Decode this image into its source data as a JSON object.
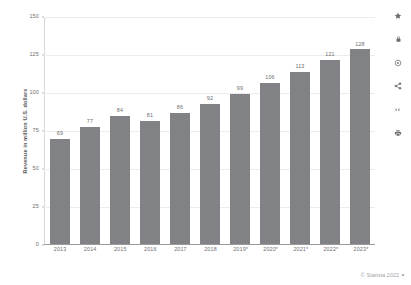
{
  "chart_data": {
    "type": "bar",
    "title": "",
    "xlabel": "",
    "ylabel": "Revenue in million U.S. dollars",
    "categories": [
      "2013",
      "2014",
      "2015",
      "2016",
      "2017",
      "2018",
      "2019*",
      "2020*",
      "2021*",
      "2022*",
      "2023*"
    ],
    "values": [
      69,
      77,
      84,
      81,
      86,
      92,
      99,
      106,
      113,
      121,
      128
    ],
    "ylim": [
      0,
      150
    ],
    "yticks": [
      "0",
      "25",
      "50",
      "75",
      "100",
      "125",
      "150"
    ],
    "ytick_values": [
      0,
      25,
      50,
      75,
      100,
      125,
      150
    ],
    "grid": true,
    "legend": "none",
    "bar_color": "#808285",
    "label_color": "#6d6e71"
  },
  "toolbar": {
    "icons": [
      {
        "name": "star-icon",
        "label": "Favorite"
      },
      {
        "name": "lock-icon",
        "label": "Locked"
      },
      {
        "name": "gear-icon",
        "label": "Settings"
      },
      {
        "name": "share-icon",
        "label": "Share"
      },
      {
        "name": "quote-icon",
        "label": "Cite"
      },
      {
        "name": "print-icon",
        "label": "Print"
      }
    ]
  },
  "footer": {
    "copyright_symbol": "©",
    "text": "Statista 2022"
  }
}
